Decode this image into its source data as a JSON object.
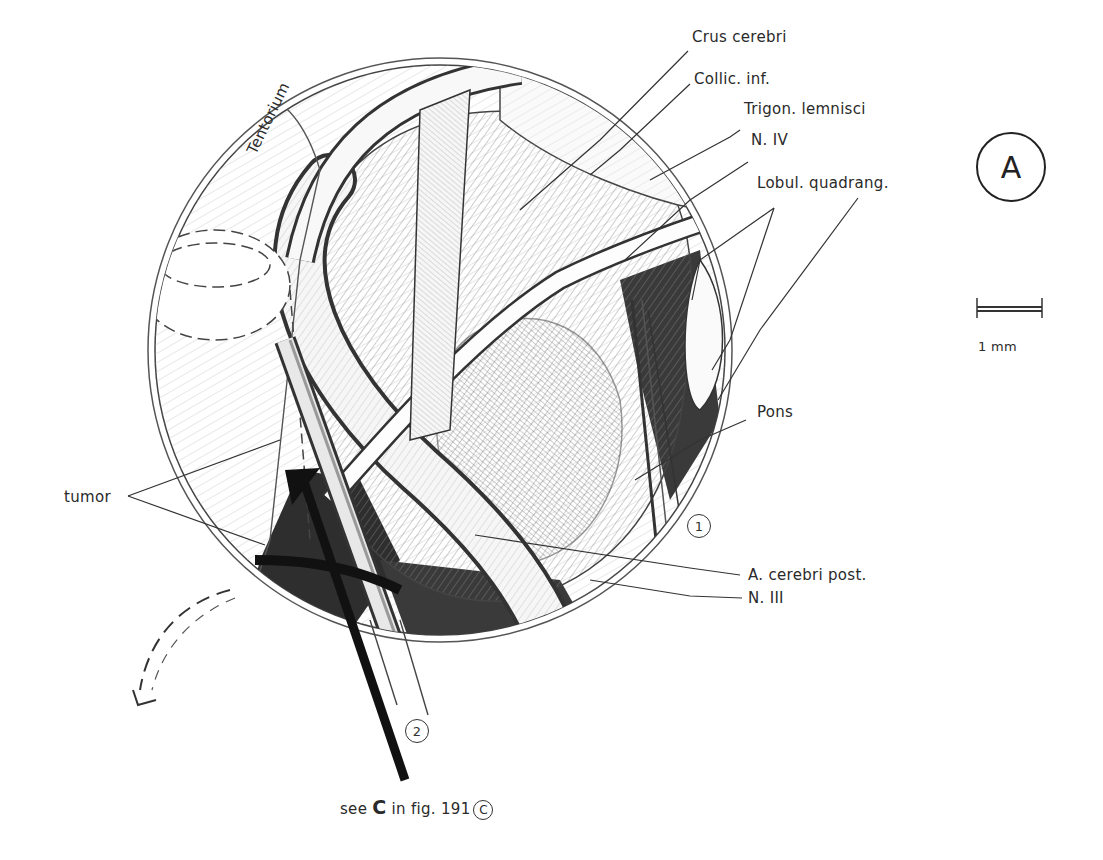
{
  "figure": {
    "panel_letter": "A",
    "scale_bar": {
      "label": "1 mm"
    },
    "caption": {
      "prefix": "see",
      "bold_letter": "C",
      "middle": "in fig.",
      "figure_number": "191",
      "circled_letter": "C"
    },
    "inner_label": "Tentorium",
    "instrument_markers": [
      {
        "id": "instrument-1",
        "label": "1"
      },
      {
        "id": "instrument-2",
        "label": "2"
      }
    ],
    "labels": {
      "crus_cerebri": "Crus cerebri",
      "collic_inf": "Collic. inf.",
      "trigon_lemnisci": "Trigon. lemnisci",
      "n_iv": "N. IV",
      "lobul_quadrang": "Lobul. quadrang.",
      "pons": "Pons",
      "a_cerebri_post": "A. cerebri post.",
      "n_iii": "N. III",
      "tumor": "tumor"
    },
    "colors": {
      "ink": "#222222",
      "background": "#ffffff",
      "shade": "#3a3a3a"
    }
  }
}
